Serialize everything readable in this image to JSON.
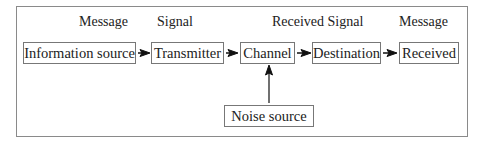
{
  "diagram": {
    "type": "communication-model",
    "top_labels": [
      "Message",
      "Signal",
      "Received Signal",
      "Message"
    ],
    "nodes": [
      {
        "id": "info",
        "label": "Information source"
      },
      {
        "id": "tx",
        "label": "Transmitter"
      },
      {
        "id": "ch",
        "label": "Channel"
      },
      {
        "id": "dest",
        "label": "Destination"
      },
      {
        "id": "rx",
        "label": "Received"
      },
      {
        "id": "noise",
        "label": "Noise source"
      }
    ],
    "edges": [
      {
        "from": "info",
        "to": "tx"
      },
      {
        "from": "tx",
        "to": "ch"
      },
      {
        "from": "ch",
        "to": "dest"
      },
      {
        "from": "dest",
        "to": "rx"
      },
      {
        "from": "noise",
        "to": "ch"
      }
    ]
  }
}
